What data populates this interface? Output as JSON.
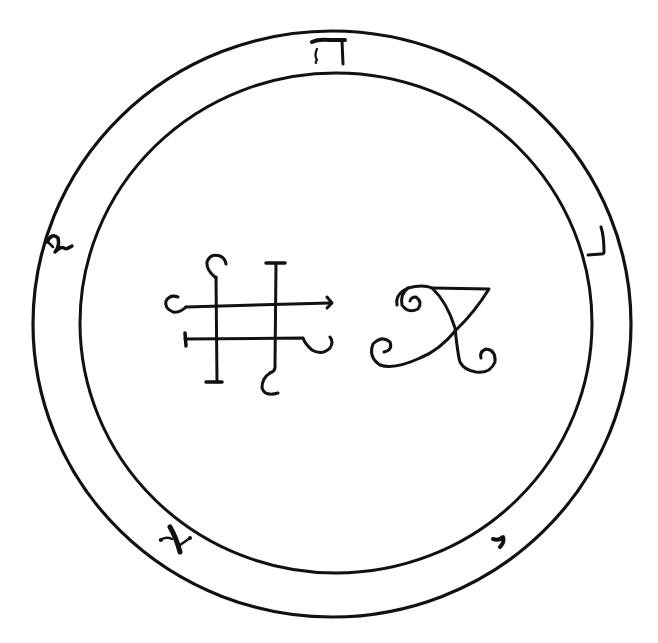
{
  "figure": {
    "type": "sigil-seal",
    "colors": {
      "ink": "#111111",
      "background": "#ffffff"
    }
  },
  "rings": {
    "outer": {
      "cx": 332,
      "cy": 324,
      "rx": 299,
      "ry": 293
    },
    "inner": {
      "cx": 336,
      "cy": 323,
      "rx": 256,
      "ry": 250
    }
  },
  "band_letters": [
    {
      "name": "he",
      "glyph": "ה",
      "position": "top"
    },
    {
      "name": "lamed-like",
      "glyph": "ל",
      "position": "left"
    },
    {
      "name": "resh-like",
      "glyph": "ר",
      "position": "right"
    },
    {
      "name": "aleph",
      "glyph": "א",
      "position": "bottom-left"
    },
    {
      "name": "yod",
      "glyph": "י",
      "position": "bottom-right"
    }
  ],
  "center_glyphs": [
    {
      "name": "lattice-sigil",
      "description": "Two horizontal and two vertical crossed bars ending in hooks and serifs"
    },
    {
      "name": "spiral-sigil",
      "description": "Looping cursive figure with three spiral curls and a triangular top"
    }
  ]
}
